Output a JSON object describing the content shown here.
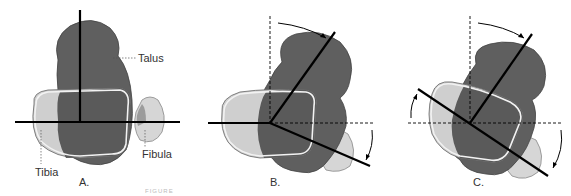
{
  "figure": {
    "panels": [
      {
        "id": "A",
        "label": "A.",
        "annotations": [
          "Talus",
          "Tibia",
          "Fibula"
        ]
      },
      {
        "id": "B",
        "label": "B."
      },
      {
        "id": "C",
        "label": "C."
      }
    ],
    "labels": {
      "talus": "Talus",
      "tibia": "Tibia",
      "fibula": "Fibula",
      "panel_a": "A.",
      "panel_b": "B.",
      "panel_c": "C."
    },
    "caption_partial": "FIGURE",
    "colors": {
      "talus": "#5f5f5f",
      "talus_dark": "#4a4a4a",
      "tibia": "#cfcfcf",
      "fibula": "#d6d6d6",
      "outline": "#f2f2f2",
      "axis": "#000000"
    }
  }
}
